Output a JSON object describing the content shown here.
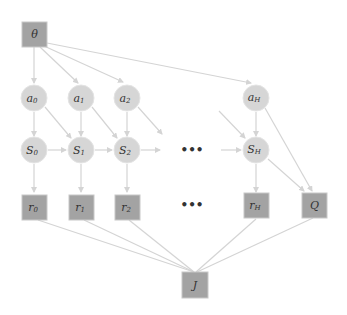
{
  "diagram": {
    "title": "",
    "colors": {
      "observed_node_fill": "#a3a3a3",
      "latent_node_fill": "#d6d6d6",
      "edge": "#d4d4d4",
      "label": "#333333"
    },
    "nodes": {
      "theta": {
        "label": "θ",
        "shape": "square"
      },
      "a0": {
        "base": "a",
        "sub": "0",
        "shape": "circle"
      },
      "a1": {
        "base": "a",
        "sub": "1",
        "shape": "circle"
      },
      "a2": {
        "base": "a",
        "sub": "2",
        "shape": "circle"
      },
      "aH": {
        "base": "a",
        "sub": "H",
        "shape": "circle"
      },
      "S0": {
        "base": "S",
        "sub": "0",
        "shape": "circle"
      },
      "S1": {
        "base": "S",
        "sub": "1",
        "shape": "circle"
      },
      "S2": {
        "base": "S",
        "sub": "2",
        "shape": "circle"
      },
      "SH": {
        "base": "S",
        "sub": "H",
        "shape": "circle"
      },
      "r0": {
        "base": "r",
        "sub": "0",
        "shape": "square"
      },
      "r1": {
        "base": "r",
        "sub": "1",
        "shape": "square"
      },
      "r2": {
        "base": "r",
        "sub": "2",
        "shape": "square"
      },
      "rH": {
        "base": "r",
        "sub": "H",
        "shape": "square"
      },
      "Q": {
        "label": "Q",
        "shape": "square"
      },
      "J": {
        "label": "J",
        "shape": "square"
      }
    },
    "ellipsis": {
      "state_row": "•••",
      "reward_row": "•••"
    },
    "edges": [
      [
        "theta",
        "a0"
      ],
      [
        "theta",
        "a1"
      ],
      [
        "theta",
        "a2"
      ],
      [
        "theta",
        "aH"
      ],
      [
        "a0",
        "S0"
      ],
      [
        "a0",
        "S1"
      ],
      [
        "a1",
        "S1"
      ],
      [
        "a1",
        "S2"
      ],
      [
        "a2",
        "S2"
      ],
      [
        "a2",
        "dots"
      ],
      [
        "aH",
        "SH"
      ],
      [
        "aH",
        "Q"
      ],
      [
        "dots",
        "SH"
      ],
      [
        "S0",
        "S1"
      ],
      [
        "S1",
        "S2"
      ],
      [
        "S2",
        "dots"
      ],
      [
        "dots",
        "SH"
      ],
      [
        "SH",
        "Q"
      ],
      [
        "S0",
        "r0"
      ],
      [
        "S1",
        "r1"
      ],
      [
        "S2",
        "r2"
      ],
      [
        "SH",
        "rH"
      ],
      [
        "r0",
        "J"
      ],
      [
        "r1",
        "J"
      ],
      [
        "r2",
        "J"
      ],
      [
        "rH",
        "J"
      ],
      [
        "Q",
        "J"
      ]
    ]
  }
}
